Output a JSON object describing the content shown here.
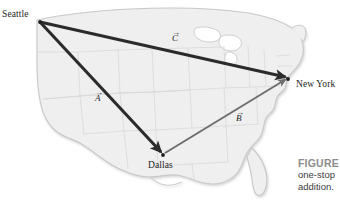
{
  "figure": {
    "type": "vector-addition-map-diagram",
    "cities": [
      {
        "id": "seattle",
        "name": "Seattle",
        "x": 40,
        "y": 22
      },
      {
        "id": "dallas",
        "name": "Dallas",
        "x": 163,
        "y": 155
      },
      {
        "id": "newyork",
        "name": "New York",
        "x": 288,
        "y": 79
      }
    ],
    "vectors": [
      {
        "id": "a",
        "label": "A",
        "accent": "→",
        "from": "seattle",
        "to": "dallas",
        "color": "#2b2b2b",
        "width": 3.1
      },
      {
        "id": "b",
        "label": "B",
        "accent": "→",
        "from": "dallas",
        "to": "newyork",
        "color": "#6e6e6e",
        "width": 2.0
      },
      {
        "id": "c",
        "label": "C",
        "accent": "→",
        "from": "seattle",
        "to": "newyork",
        "color": "#2b2b2b",
        "width": 3.1
      }
    ],
    "caption": {
      "title": "FIGURE",
      "lines": [
        "one-stop",
        "addition."
      ]
    },
    "colors": {
      "map_fill": "#efefef",
      "map_stroke": "#c9c9c9",
      "state_line": "#d8d8d8",
      "vector_dark": "#2b2b2b",
      "vector_gray": "#6e6e6e",
      "caption_title": "#8c8c8c",
      "caption_text": "#3c3c3c",
      "background": "#ffffff"
    }
  }
}
